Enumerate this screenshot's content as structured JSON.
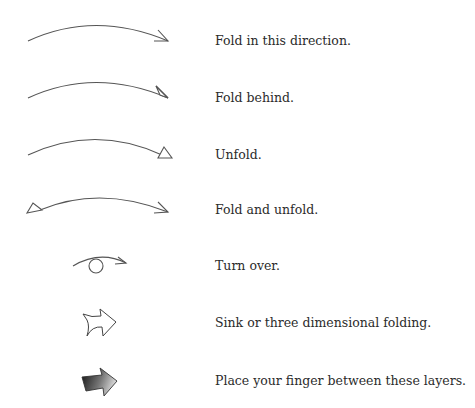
{
  "legend": {
    "items": [
      {
        "symbol": "valley-fold-arrow-icon",
        "label": "Fold in this direction."
      },
      {
        "symbol": "mountain-fold-arrow-icon",
        "label": "Fold behind."
      },
      {
        "symbol": "unfold-arrow-icon",
        "label": "Unfold."
      },
      {
        "symbol": "fold-and-unfold-arrow-icon",
        "label": "Fold and unfold."
      },
      {
        "symbol": "turn-over-arrow-icon",
        "label": "Turn over."
      },
      {
        "symbol": "sink-arrow-icon",
        "label": "Sink or three dimensional folding."
      },
      {
        "symbol": "place-finger-arrow-icon",
        "label": "Place your finger between these layers."
      }
    ]
  },
  "colors": {
    "stroke": "#555555",
    "text": "#2b2b2b",
    "gradient_dark": "#1a1a1a",
    "gradient_light": "#d8d8d8",
    "background": "#ffffff"
  }
}
